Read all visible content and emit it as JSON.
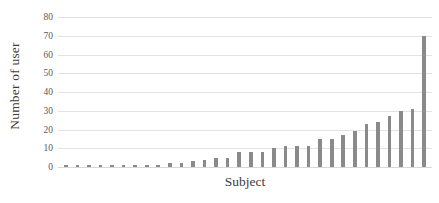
{
  "chart_data": {
    "type": "bar",
    "title": "",
    "xlabel": "Subject",
    "ylabel": "Number of user",
    "ylim": [
      0,
      80
    ],
    "ytick_labels": [
      "80",
      "70",
      "60",
      "50",
      "40",
      "30",
      "20",
      "10",
      "0"
    ],
    "yticks": [
      80,
      70,
      60,
      50,
      40,
      30,
      20,
      10,
      0
    ],
    "grid": true,
    "legend": "none",
    "xtick_labels": [],
    "categories": [
      "1",
      "2",
      "3",
      "4",
      "5",
      "6",
      "7",
      "8",
      "9",
      "10",
      "11",
      "12",
      "13",
      "14",
      "15",
      "16",
      "17",
      "18",
      "19",
      "20",
      "21",
      "22",
      "23",
      "24",
      "25",
      "26",
      "27",
      "28",
      "29",
      "30",
      "31"
    ],
    "values": [
      1,
      1,
      1,
      1,
      1,
      1,
      1,
      1,
      1,
      2,
      2,
      3,
      4,
      5,
      5,
      8,
      8,
      8,
      10,
      11,
      11,
      11,
      15,
      15,
      17,
      19,
      23,
      24,
      27,
      30,
      31
    ],
    "extra_values": [
      70
    ],
    "all_values": [
      1,
      1,
      1,
      1,
      1,
      1,
      1,
      1,
      1,
      2,
      2,
      3,
      4,
      5,
      5,
      8,
      8,
      8,
      10,
      11,
      11,
      11,
      15,
      15,
      17,
      19,
      23,
      24,
      27,
      30,
      31,
      70
    ],
    "bar_color": "#8a8a8a",
    "gridline_color": "#e3e3e3",
    "background_color": "#ffffff"
  }
}
